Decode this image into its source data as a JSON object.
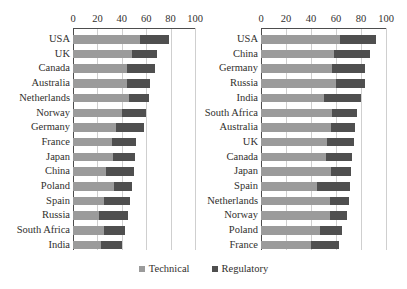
{
  "figure": {
    "top_artifact_text": "",
    "legend": {
      "position": "bottom-center",
      "items": [
        {
          "label": "Technical",
          "color": "#9b9b9b",
          "key": "technical"
        },
        {
          "label": "Regulatory",
          "color": "#4f4f4f",
          "key": "regulatory"
        }
      ]
    }
  },
  "chart_data": [
    {
      "id": "left-chart",
      "type": "bar",
      "orientation": "horizontal",
      "stacked": true,
      "title": "",
      "xlabel": "",
      "ylabel": "",
      "xlim": [
        0,
        100
      ],
      "xticks": [
        0,
        20,
        40,
        60,
        80,
        100
      ],
      "tick_labels": [
        "0",
        "20",
        "40",
        "60",
        "80",
        "100"
      ],
      "grid": true,
      "categories": [
        "USA",
        "UK",
        "Canada",
        "Australia",
        "Netherlands",
        "Norway",
        "Germany",
        "France",
        "Japan",
        "China",
        "Poland",
        "Spain",
        "Russia",
        "South Africa",
        "India"
      ],
      "series": [
        {
          "name": "Technical",
          "color": "#9b9b9b",
          "values": [
            55,
            48,
            44,
            44,
            46,
            40,
            35,
            32,
            33,
            27,
            34,
            25,
            21,
            25,
            23
          ]
        },
        {
          "name": "Regulatory",
          "color": "#4f4f4f",
          "values": [
            24,
            21,
            23,
            19,
            16,
            20,
            23,
            20,
            18,
            23,
            14,
            22,
            24,
            18,
            17
          ]
        }
      ],
      "totals": [
        79,
        69,
        67,
        63,
        62,
        60,
        58,
        52,
        51,
        50,
        48,
        47,
        45,
        43,
        40
      ]
    },
    {
      "id": "right-chart",
      "type": "bar",
      "orientation": "horizontal",
      "stacked": true,
      "title": "",
      "xlabel": "",
      "ylabel": "",
      "xlim": [
        0,
        100
      ],
      "xticks": [
        0,
        20,
        40,
        60,
        80,
        100
      ],
      "tick_labels": [
        "0",
        "20",
        "40",
        "60",
        "80",
        "100"
      ],
      "grid": true,
      "categories": [
        "USA",
        "China",
        "Germany",
        "Russia",
        "India",
        "South Africa",
        "Australia",
        "UK",
        "Canada",
        "Japan",
        "Spain",
        "Netherlands",
        "Norway",
        "Poland",
        "France"
      ],
      "series": [
        {
          "name": "Technical",
          "color": "#9b9b9b",
          "values": [
            63,
            58,
            57,
            60,
            50,
            57,
            56,
            53,
            52,
            56,
            45,
            55,
            55,
            47,
            40
          ]
        },
        {
          "name": "Regulatory",
          "color": "#4f4f4f",
          "values": [
            29,
            29,
            26,
            23,
            30,
            20,
            19,
            21,
            21,
            16,
            26,
            15,
            14,
            18,
            22
          ]
        }
      ],
      "totals": [
        92,
        87,
        83,
        83,
        80,
        77,
        75,
        74,
        73,
        72,
        71,
        70,
        69,
        65,
        62
      ]
    }
  ]
}
